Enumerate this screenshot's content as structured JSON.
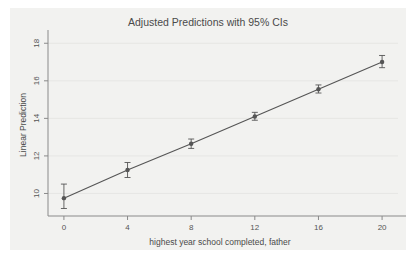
{
  "figure": {
    "title": "Adjusted Predictions with 95% CIs",
    "background_color": "#ffffff",
    "card_color": "#f2f2f0",
    "axis_color": "#8a8a8a",
    "grid_color": "#e3e3e1",
    "series_color": "#555555",
    "text_color": "#4a4a4a"
  },
  "chart_data": {
    "type": "line",
    "title": "Adjusted Predictions with 95% CIs",
    "xlabel": "highest year school completed, father",
    "ylabel": "Linear Prediction",
    "xlim": [
      -1,
      21
    ],
    "ylim": [
      8.8,
      18.6
    ],
    "xticks": [
      0,
      4,
      8,
      12,
      16,
      20
    ],
    "xticklabels": [
      "0",
      "4",
      "8",
      "12",
      "16",
      "20"
    ],
    "yticks": [
      10,
      12,
      14,
      16,
      18
    ],
    "yticklabels": [
      "10",
      "12",
      "14",
      "16",
      "18"
    ],
    "grid": "horizontal",
    "legend": "none",
    "marker": "filled-circle",
    "errorbar": "95% CI",
    "x": [
      0,
      4,
      8,
      12,
      16,
      20
    ],
    "values": [
      9.75,
      11.25,
      12.65,
      14.1,
      15.55,
      17.0
    ],
    "ci_low": [
      9.2,
      10.85,
      12.4,
      13.9,
      15.35,
      16.7
    ],
    "ci_high": [
      10.5,
      11.65,
      12.9,
      14.32,
      15.78,
      17.35
    ],
    "series": [
      {
        "name": "Linear Prediction",
        "values": [
          9.75,
          11.25,
          12.65,
          14.1,
          15.55,
          17.0
        ]
      }
    ]
  }
}
